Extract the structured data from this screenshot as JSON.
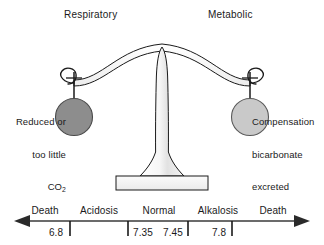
{
  "figure": {
    "background_color": "#ffffff",
    "stroke_color": "#1a1a1a"
  },
  "headings": {
    "left": "Respiratory",
    "right": "Metabolic"
  },
  "pans": {
    "left": {
      "fill_color": "#8d8d8d",
      "label_lines": [
        "Reduced or",
        "too little",
        "CO"
      ],
      "label_subscript": "2"
    },
    "right": {
      "fill_color": "#c9c9c9",
      "label_lines": [
        "Compensation",
        "bicarbonate",
        "excreted"
      ]
    }
  },
  "fulcrum": {
    "fill_color": "#f2f2f2",
    "base_fill_color": "#f0f0f0"
  },
  "ph_axis": {
    "zones": [
      {
        "name": "death-left",
        "label": "Death"
      },
      {
        "name": "acidosis",
        "label": "Acidosis"
      },
      {
        "name": "normal",
        "label": "Normal"
      },
      {
        "name": "alkalosis",
        "label": "Alkalosis"
      },
      {
        "name": "death-right",
        "label": "Death"
      }
    ],
    "tick_values": [
      "6.8",
      "7.35",
      "7.45",
      "7.8"
    ],
    "arrow_left": true,
    "arrow_right": true
  }
}
